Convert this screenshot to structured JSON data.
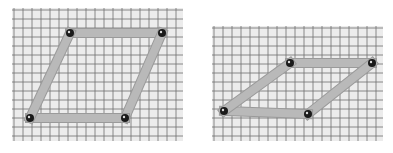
{
  "figures": [
    {
      "id": "left",
      "description": "Four-bar linkage forming a tall parallelogram on grid paper",
      "grid": {
        "x": 12,
        "y": 8,
        "w": 171,
        "h": 133,
        "cell": 9
      },
      "pivots": [
        [
          70,
          33
        ],
        [
          162,
          33
        ],
        [
          125,
          118
        ],
        [
          30,
          118
        ]
      ]
    },
    {
      "id": "right",
      "description": "Same linkage sheared into a flatter parallelogram on grid paper",
      "grid": {
        "x": 212,
        "y": 26,
        "w": 171,
        "h": 115,
        "cell": 9
      },
      "pivots": [
        [
          290,
          63
        ],
        [
          372,
          63
        ],
        [
          308,
          114
        ],
        [
          224,
          111
        ]
      ]
    }
  ],
  "colors": {
    "paper": "#ececec",
    "grid": "#6e6e6e",
    "bar": "#b9b9b9",
    "bar_edge": "#9a9a9a",
    "pivot": "#1a1a1a"
  }
}
